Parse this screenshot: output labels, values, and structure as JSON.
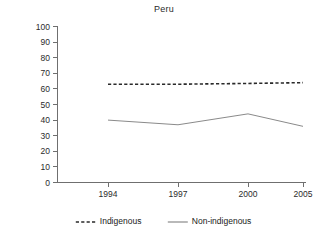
{
  "chart_data": {
    "type": "line",
    "title": "Peru",
    "xlabel": "",
    "ylabel": "",
    "categories": [
      "1994",
      "1997",
      "2000",
      "2005"
    ],
    "x_tick_labels": [
      "1994",
      "1997",
      "2000",
      "2005"
    ],
    "y_tick_labels": [
      "0",
      "10",
      "20",
      "30",
      "40",
      "50",
      "60",
      "70",
      "80",
      "90",
      "100"
    ],
    "y_tick_values": [
      0,
      10,
      20,
      30,
      40,
      50,
      60,
      70,
      80,
      90,
      100
    ],
    "ylim": [
      0,
      100
    ],
    "grid": false,
    "legend_position": "bottom",
    "series": [
      {
        "name": "Indigenous",
        "style": "dashed",
        "color": "#2a2a2a",
        "values": [
          63,
          63,
          63.5,
          64
        ]
      },
      {
        "name": "Non-indigenous",
        "style": "solid",
        "color": "#8a8a8a",
        "values": [
          40,
          37,
          44,
          36
        ]
      }
    ]
  },
  "legend": {
    "entries": [
      {
        "label": "Indigenous",
        "style": "dashed"
      },
      {
        "label": "Non-indigenous",
        "style": "solid"
      }
    ]
  }
}
